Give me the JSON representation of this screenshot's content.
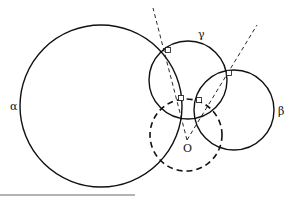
{
  "diagram": {
    "width": 295,
    "height": 197,
    "stroke_color": "#111111",
    "circles": [
      {
        "name": "alpha",
        "label": "α",
        "cx": 101,
        "cy": 106,
        "r": 81,
        "dashed": false,
        "label_x": 10,
        "label_y": 110
      },
      {
        "name": "gamma",
        "label": "γ",
        "cx": 188,
        "cy": 80,
        "r": 39,
        "dashed": false,
        "label_x": 198,
        "label_y": 38
      },
      {
        "name": "beta",
        "label": "β",
        "cx": 234,
        "cy": 110,
        "r": 40,
        "dashed": false,
        "label_x": 278,
        "label_y": 115
      },
      {
        "name": "orthogonal-circle",
        "label": "",
        "cx": 186,
        "cy": 135,
        "r": 36,
        "dashed": true
      }
    ],
    "center_point": {
      "label": "O",
      "x": 187,
      "y": 140,
      "label_x": 183,
      "label_y": 152
    },
    "dashed_lines": [
      {
        "name": "line-o-alpha-gamma",
        "x1": 187,
        "y1": 140,
        "x2": 153,
        "y2": 8
      },
      {
        "name": "line-o-gamma-beta",
        "x1": 187,
        "y1": 140,
        "x2": 257,
        "y2": 25
      }
    ],
    "right_angle_marks": [
      {
        "x": 168,
        "y": 50
      },
      {
        "x": 229,
        "y": 73
      },
      {
        "x": 181,
        "y": 98
      },
      {
        "x": 199,
        "y": 100
      }
    ],
    "bottom_rule": {
      "x1": 0,
      "y1": 195,
      "x2": 135,
      "y2": 195,
      "color": "#9a9a9a"
    }
  }
}
